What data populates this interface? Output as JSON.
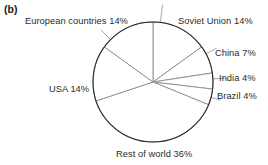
{
  "figure": {
    "panel_label": "(b)"
  },
  "chart_data": {
    "type": "pie",
    "title": "",
    "xlabel": "",
    "ylabel": "",
    "legend_position": "outside-labels",
    "grid": false,
    "start_angle_deg": 0,
    "direction": "clockwise",
    "units": "percent",
    "categories": [
      "Soviet Union",
      "China",
      "India",
      "Brazil",
      "Rest of world",
      "USA",
      "European countries"
    ],
    "values": [
      14,
      7,
      4,
      4,
      36,
      14,
      14
    ],
    "labels": [
      "Soviet Union 14%",
      "China 7%",
      "India 4%",
      "Brazil 4%",
      "Rest of world 36%",
      "USA 14%",
      "European countries 14%"
    ],
    "slice_fill": "#ffffff",
    "slice_stroke": "#8c8c8c",
    "outline_stroke": "#2b2b2b"
  },
  "colors": {
    "text": "#2b2b2b",
    "panel_label": "#1a1a1a",
    "background": "#ffffff",
    "circle_outline": "#2b2b2b",
    "radii": "#909090"
  }
}
